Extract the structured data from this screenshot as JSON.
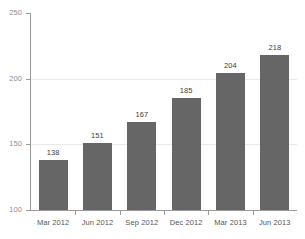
{
  "chart_data": {
    "type": "bar",
    "title": "",
    "subtitle": "",
    "xlabel": "",
    "ylabel": "",
    "categories": [
      "Mar 2012",
      "Jun 2012",
      "Sep 2012",
      "Dec 2012",
      "Mar 2013",
      "Jun 2013"
    ],
    "values": [
      138,
      151,
      167,
      185,
      204,
      218
    ],
    "value_labels": [
      "138",
      "151",
      "167",
      "185",
      "204",
      "218"
    ],
    "ylim": [
      100,
      250
    ],
    "yticks": [
      100,
      150,
      200,
      250
    ],
    "ytick_labels": [
      "100",
      "150",
      "200",
      "250"
    ],
    "grid": true,
    "gridlines_at": [
      150,
      200
    ],
    "legend": null,
    "legend_position": "none",
    "bar_color": "#666666",
    "axis_color": "#9a9a9a",
    "grid_color": "#e9e9e9",
    "label_color": "#3b3b3b",
    "tick_label_color": "#8d8d8d",
    "background_color": "#ffffff"
  }
}
